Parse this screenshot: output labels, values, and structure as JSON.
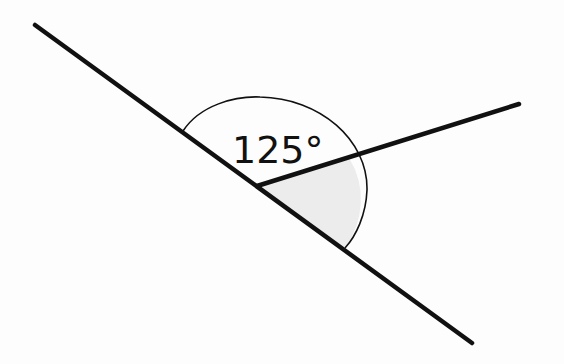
{
  "diagram": {
    "type": "angle-diagram",
    "angle_label": "125°",
    "angle_value_degrees": 125,
    "colors": {
      "line": "#111111",
      "shaded_region": "#ececec",
      "background": "#fdfdfd"
    },
    "elements": {
      "main_line": {
        "from": [
          35,
          25
        ],
        "to": [
          472,
          343
        ]
      },
      "ray": {
        "from": [
          257,
          186
        ],
        "to": [
          519,
          104
        ]
      },
      "vertex": [
        257,
        186
      ],
      "arc": {
        "start": [
          183,
          131
        ],
        "end": [
          345,
          248
        ]
      },
      "shaded_sector": "between ray and lower part of main line"
    }
  }
}
